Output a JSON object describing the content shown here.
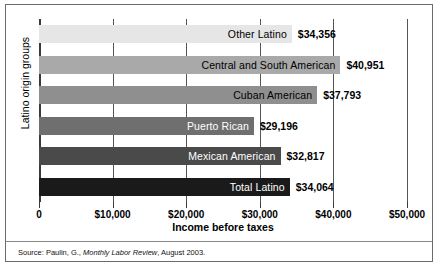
{
  "chart_data": {
    "type": "bar",
    "orientation": "horizontal",
    "title": "",
    "xlabel": "Income before taxes",
    "ylabel": "Latino origin groups",
    "xlim": [
      0,
      50000
    ],
    "grid": true,
    "legend": "none",
    "xticks": [
      "0",
      "$10,000",
      "$20,000",
      "$30,000",
      "$40,000",
      "$50,000"
    ],
    "xtick_values": [
      0,
      10000,
      20000,
      30000,
      40000,
      50000
    ],
    "categories": [
      "Other Latino",
      "Central and South American",
      "Cuban American",
      "Puerto Rican",
      "Mexican American",
      "Total Latino"
    ],
    "values": [
      34356,
      40951,
      37793,
      29196,
      32817,
      34064
    ],
    "value_labels": [
      "$34,356",
      "$40,951",
      "$37,793",
      "$29,196",
      "$32,817",
      "$34,064"
    ],
    "bar_colors": [
      "#e6e6e6",
      "#a9a9a9",
      "#8f8f8f",
      "#6f6f6f",
      "#4a4a4a",
      "#1a1a1a"
    ],
    "label_text_colors": [
      "#000000",
      "#000000",
      "#000000",
      "#ffffff",
      "#ffffff",
      "#ffffff"
    ]
  },
  "source": {
    "prefix": "Source: Paulin, G.,",
    "italic": " Monthly Labor Review",
    "suffix": ", August 2003."
  }
}
